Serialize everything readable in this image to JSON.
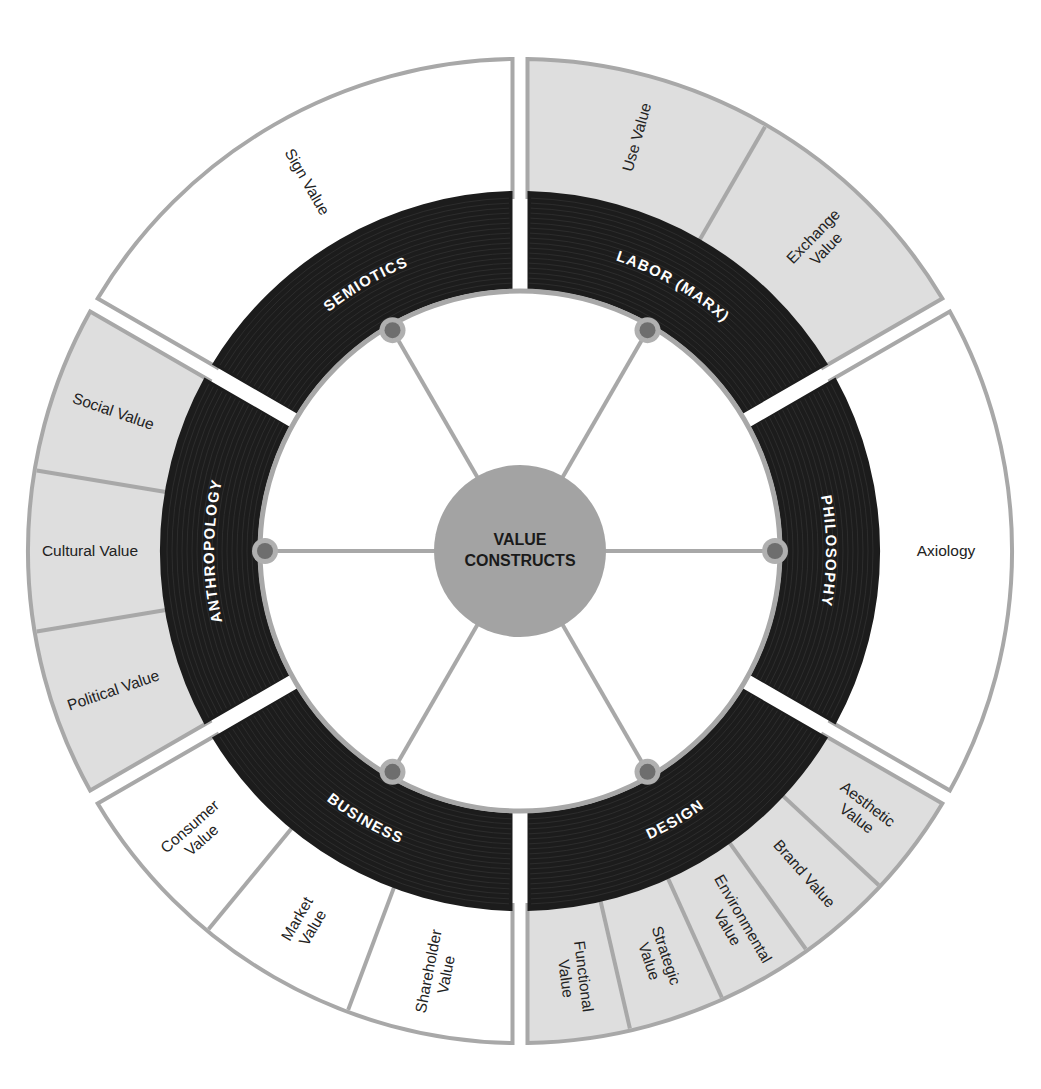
{
  "diagram": {
    "center_label": [
      "VALUE",
      "CONSTRUCTS"
    ],
    "colors": {
      "ring_dark": "#1c1c1c",
      "ring_line": "#3a3a3a",
      "border_gray": "#a8a8a8",
      "fill_gray": "#dedede",
      "fill_white": "#ffffff",
      "hub_fill": "#a3a3a3",
      "node_outer": "#b0b0b0",
      "node_inner": "#6e6e6e",
      "spoke": "#a8a8a8",
      "text_dark": "#222222",
      "text_light": "#ffffff"
    },
    "sectors": [
      {
        "name": "LABOR (MARX)",
        "shade": "gray",
        "items": [
          {
            "label": [
              "Use Value"
            ]
          },
          {
            "label": [
              "Exchange",
              "Value"
            ]
          }
        ]
      },
      {
        "name": "PHILOSOPHY",
        "shade": "white",
        "items": [
          {
            "label": [
              "Axiology"
            ]
          }
        ]
      },
      {
        "name": "DESIGN",
        "shade": "gray",
        "items": [
          {
            "label": [
              "Aesthetic",
              "Value"
            ]
          },
          {
            "label": [
              "Brand Value"
            ]
          },
          {
            "label": [
              "Environmental",
              "Value"
            ]
          },
          {
            "label": [
              "Strategic",
              "Value"
            ]
          },
          {
            "label": [
              "Functional",
              "Value"
            ]
          }
        ]
      },
      {
        "name": "BUSINESS",
        "shade": "white",
        "items": [
          {
            "label": [
              "Shareholder",
              "Value"
            ]
          },
          {
            "label": [
              "Market",
              "Value"
            ]
          },
          {
            "label": [
              "Consumer",
              "Value"
            ]
          }
        ]
      },
      {
        "name": "ANTHROPOLOGY",
        "shade": "gray",
        "items": [
          {
            "label": [
              "Political Value"
            ]
          },
          {
            "label": [
              "Cultural Value"
            ]
          },
          {
            "label": [
              "Social Value"
            ]
          }
        ]
      },
      {
        "name": "SEMIOTICS",
        "shade": "white",
        "items": [
          {
            "label": [
              "Sign Value"
            ]
          }
        ]
      }
    ]
  }
}
